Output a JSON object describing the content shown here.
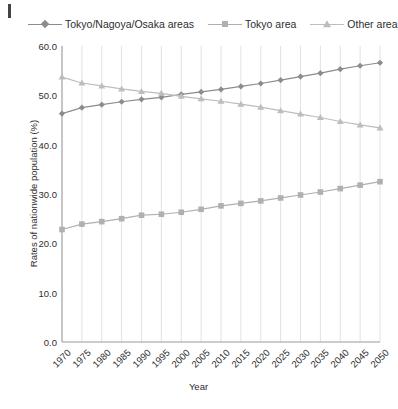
{
  "figure": {
    "background": "#ffffff",
    "corner_mark": "page-corner-mark"
  },
  "chart_data": {
    "type": "line",
    "title": "",
    "xlabel": "Year",
    "ylabel": "Rates of nationwide population (%)",
    "x": [
      1970,
      1975,
      1980,
      1985,
      1990,
      1995,
      2000,
      2005,
      2010,
      2015,
      2020,
      2025,
      2030,
      2035,
      2040,
      2045,
      2050
    ],
    "categories": [
      "1970",
      "1975",
      "1980",
      "1985",
      "1990",
      "1995",
      "2000",
      "2005",
      "2010",
      "2015",
      "2020",
      "2025",
      "2030",
      "2035",
      "2040",
      "2045",
      "2050"
    ],
    "xlim": [
      1970,
      2050
    ],
    "ylim": [
      0.0,
      60.0
    ],
    "yticks": [
      0.0,
      10.0,
      20.0,
      30.0,
      40.0,
      50.0,
      60.0
    ],
    "ytick_labels": [
      "0.0",
      "10.0",
      "20.0",
      "30.0",
      "40.0",
      "50.0",
      "60.0"
    ],
    "grid": "vertical-only",
    "legend_position": "top",
    "series": [
      {
        "name": "Tokyo/Nagoya/Osaka areas",
        "marker": "diamond",
        "color": "#8c8c8c",
        "values": [
          46.3,
          47.5,
          48.1,
          48.7,
          49.2,
          49.6,
          50.2,
          50.7,
          51.2,
          51.8,
          52.4,
          53.1,
          53.8,
          54.5,
          55.3,
          56.0,
          56.6
        ]
      },
      {
        "name": "Tokyo area",
        "marker": "square",
        "color": "#b0b0b0",
        "values": [
          22.8,
          23.9,
          24.4,
          25.0,
          25.7,
          25.9,
          26.3,
          26.9,
          27.6,
          28.1,
          28.6,
          29.2,
          29.8,
          30.4,
          31.1,
          31.8,
          32.5
        ]
      },
      {
        "name": "Other area",
        "marker": "triangle",
        "color": "#bdbdbd",
        "values": [
          53.7,
          52.5,
          51.9,
          51.3,
          50.8,
          50.4,
          49.8,
          49.3,
          48.8,
          48.2,
          47.6,
          46.9,
          46.2,
          45.5,
          44.7,
          44.0,
          43.4
        ]
      }
    ]
  }
}
